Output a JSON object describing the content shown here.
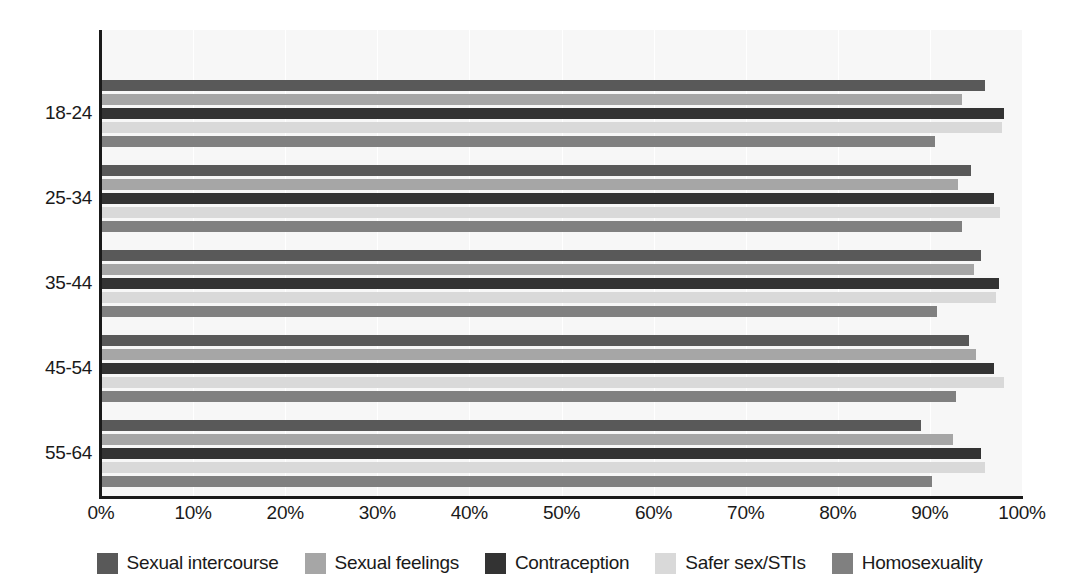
{
  "chart_data": {
    "type": "bar",
    "orientation": "horizontal",
    "title": "",
    "subtitle": "",
    "xlabel": "",
    "ylabel": "",
    "xlim": [
      0,
      100
    ],
    "xticks": [
      "0%",
      "10%",
      "20%",
      "30%",
      "40%",
      "50%",
      "60%",
      "70%",
      "80%",
      "90%",
      "100%"
    ],
    "xtick_values": [
      0,
      10,
      20,
      30,
      40,
      50,
      60,
      70,
      80,
      90,
      100
    ],
    "grid": true,
    "grid_axis": "x",
    "legend_position": "bottom",
    "categories": [
      "18-24",
      "25-34",
      "35-44",
      "45-54",
      "55-64"
    ],
    "series": [
      {
        "name": "Sexual intercourse",
        "color": "#595959",
        "values": [
          96.0,
          94.5,
          95.5,
          94.2,
          89.0
        ]
      },
      {
        "name": "Sexual feelings",
        "color": "#a6a6a6",
        "values": [
          93.5,
          93.0,
          94.8,
          95.0,
          92.5
        ]
      },
      {
        "name": "Contraception",
        "color": "#333333",
        "values": [
          98.0,
          97.0,
          97.5,
          97.0,
          95.5
        ]
      },
      {
        "name": "Safer sex/STIs",
        "color": "#d9d9d9",
        "values": [
          97.8,
          97.6,
          97.2,
          98.0,
          96.0
        ]
      },
      {
        "name": "Homosexuality",
        "color": "#808080",
        "values": [
          90.5,
          93.5,
          90.8,
          92.8,
          90.2
        ]
      }
    ]
  },
  "legend": {
    "items": [
      {
        "label": "Sexual intercourse",
        "color": "#595959"
      },
      {
        "label": "Sexual feelings",
        "color": "#a6a6a6"
      },
      {
        "label": "Contraception",
        "color": "#333333"
      },
      {
        "label": "Safer sex/STIs",
        "color": "#d9d9d9"
      },
      {
        "label": "Homosexuality",
        "color": "#808080"
      }
    ]
  },
  "axes": {
    "plot_background": "#f7f7f7",
    "axis_color": "#1a1a1a",
    "gridline_color": "#ffffff"
  }
}
